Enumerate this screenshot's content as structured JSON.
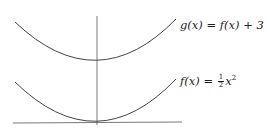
{
  "diagram": {
    "type": "function-graph",
    "colors": {
      "curve": "#444444",
      "axis": "#555555",
      "text": "#222222",
      "background": "#ffffff"
    },
    "axes": {
      "x_axis": {
        "x1": 13,
        "y1": 123,
        "x2": 182,
        "y2": 122
      },
      "y_axis": {
        "x1": 97,
        "y1": 16,
        "x2": 97,
        "y2": 125
      }
    },
    "curves": [
      {
        "name": "g",
        "label_lhs": "g(x)",
        "label_eq": "=",
        "label_rhs": "f(x) + 3",
        "label_full": "g(x) = f(x) + 3",
        "left": [
          15,
          22
        ],
        "vertex": [
          97,
          61
        ],
        "right": [
          176,
          19
        ]
      },
      {
        "name": "f",
        "label_lhs": "f(x)",
        "label_eq": "=",
        "label_num": "1",
        "label_den": "2",
        "label_var": "x",
        "label_exp": "2",
        "label_full": "f(x) = 1/2 x^2",
        "left": [
          15,
          82
        ],
        "vertex": [
          97,
          123
        ],
        "right": [
          176,
          79
        ]
      }
    ]
  }
}
